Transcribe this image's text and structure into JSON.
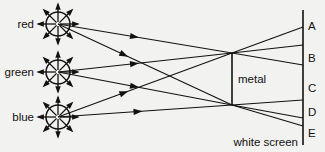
{
  "figure": {
    "background_color": "#f2f2f0",
    "ink_color": "#111111"
  },
  "sources": [
    {
      "id": "red",
      "label": "red",
      "center_x": 58,
      "center_y": 24,
      "radius": 12,
      "icon": "radiating-light-source-icon"
    },
    {
      "id": "green",
      "label": "green",
      "center_x": 58,
      "center_y": 72,
      "radius": 12,
      "icon": "radiating-light-source-icon"
    },
    {
      "id": "blue",
      "label": "blue",
      "center_x": 58,
      "center_y": 117,
      "radius": 12,
      "icon": "radiating-light-source-icon"
    }
  ],
  "obstacle": {
    "label": "metal",
    "x": 232,
    "y_top": 53,
    "y_bottom": 105,
    "label_x": 238,
    "label_y": 83
  },
  "screen": {
    "label": "white screen",
    "x": 303,
    "y_top": 10,
    "y_bottom": 145,
    "label_x": 298,
    "label_y": 146,
    "points": [
      {
        "label": "A",
        "y": 26,
        "label_x": 308,
        "label_y": 30
      },
      {
        "label": "B",
        "y": 58,
        "label_x": 308,
        "label_y": 62
      },
      {
        "label": "C",
        "y": 88,
        "label_x": 308,
        "label_y": 92
      },
      {
        "label": "D",
        "y": 112,
        "label_x": 308,
        "label_y": 116
      },
      {
        "label": "E",
        "y": 133,
        "label_x": 308,
        "label_y": 137
      }
    ]
  },
  "rays": [
    {
      "from": "red",
      "via": "metal-top",
      "x1": 58,
      "y1": 24,
      "x2": 232,
      "y2": 53,
      "x3": 303,
      "y3": 65,
      "arrow_t": 0.44
    },
    {
      "from": "red",
      "via": "metal-bottom",
      "x1": 58,
      "y1": 24,
      "x2": 232,
      "y2": 105,
      "x3": 303,
      "y3": 126,
      "arrow_t": 0.38
    },
    {
      "from": "green",
      "via": "metal-top",
      "x1": 58,
      "y1": 72,
      "x2": 232,
      "y2": 53,
      "x3": 303,
      "y3": 45,
      "arrow_t": 0.44
    },
    {
      "from": "green",
      "via": "metal-bottom",
      "x1": 58,
      "y1": 72,
      "x2": 232,
      "y2": 105,
      "x3": 303,
      "y3": 118,
      "arrow_t": 0.44
    },
    {
      "from": "blue",
      "via": "metal-top",
      "x1": 58,
      "y1": 117,
      "x2": 232,
      "y2": 53,
      "x3": 303,
      "y3": 27,
      "arrow_t": 0.38
    },
    {
      "from": "blue",
      "via": "metal-bottom",
      "x1": 58,
      "y1": 117,
      "x2": 232,
      "y2": 105,
      "x3": 303,
      "y3": 100,
      "arrow_t": 0.46
    }
  ]
}
